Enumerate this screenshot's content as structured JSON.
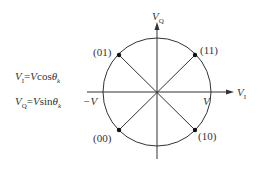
{
  "diagram": {
    "type": "QPSK constellation",
    "axes": {
      "horizontal": {
        "label": "V",
        "subscript": "I"
      },
      "vertical": {
        "label": "V",
        "subscript": "Q"
      },
      "negative_amplitude": "−V",
      "positive_amplitude": "V"
    },
    "equations": [
      {
        "lhs": "V",
        "lhs_sub": "I",
        "eq": "=",
        "rhs_var": "V",
        "func": "cos",
        "theta": "θ",
        "theta_sub": "k"
      },
      {
        "lhs": "V",
        "lhs_sub": "Q",
        "eq": "=",
        "rhs_var": "V",
        "func": "sin",
        "theta": "θ",
        "theta_sub": "k"
      }
    ],
    "points": [
      {
        "label": "(01)",
        "quadrant": "upper-left"
      },
      {
        "label": "(11)",
        "quadrant": "upper-right"
      },
      {
        "label": "(00)",
        "quadrant": "lower-left"
      },
      {
        "label": "(10)",
        "quadrant": "lower-right"
      }
    ],
    "colors": {
      "line": "#333333",
      "background": "#ffffff"
    }
  }
}
